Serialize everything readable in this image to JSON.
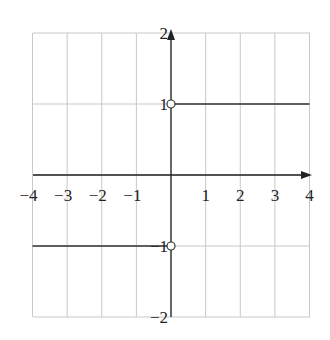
{
  "chart_data": {
    "type": "line",
    "title": "",
    "xlabel": "",
    "ylabel": "",
    "xlim": [
      -4,
      4
    ],
    "ylim": [
      -2,
      2
    ],
    "grid": true,
    "x_tick_labels": [
      "−4",
      "−3",
      "−2",
      "−1",
      "1",
      "2",
      "3",
      "4"
    ],
    "y_tick_labels": [
      "2",
      "1",
      "−1",
      "−2"
    ],
    "series": [
      {
        "name": "y = 1 for x > 0",
        "x": [
          0,
          4
        ],
        "y": [
          1,
          1
        ]
      },
      {
        "name": "y = -1 for x < 0",
        "x": [
          -4,
          0
        ],
        "y": [
          -1,
          -1
        ]
      }
    ],
    "open_points": [
      [
        0,
        1
      ],
      [
        0,
        -1
      ]
    ],
    "colors": {
      "grid": "#c8c8c8",
      "axis": "#222222",
      "line": "#333333"
    }
  }
}
